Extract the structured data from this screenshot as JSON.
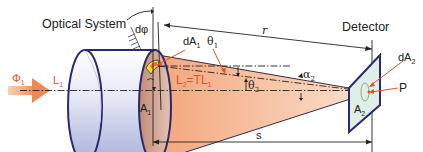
{
  "diagram": {
    "title_labels": {
      "optical_system": "Optical System",
      "detector": "Detector"
    },
    "symbols": {
      "d_phi": "dφ",
      "r": "r",
      "dA1": "dA",
      "dA1_sub": "1",
      "theta1": "θ",
      "theta1_sub": "1",
      "theta2": "θ",
      "theta2_sub": "2",
      "alpha2": "α",
      "alpha2_sub": "2",
      "dA2": "dA",
      "dA2_sub": "2",
      "P": "P",
      "Phi1": "Φ",
      "Phi1_sub": "1",
      "L1": "L",
      "L1_sub": "1",
      "L2_eq": "L",
      "L2_sub": "2",
      "L2_rhs": "=TL",
      "L2_rhs_sub": "1",
      "A1": "A",
      "A1_sub": "1",
      "A2": "A",
      "A2_sub": "2",
      "s": "s"
    },
    "colors": {
      "outline": "#2a2a6e",
      "cone_fill": "#f7b995",
      "red_label": "#e2522a",
      "arrow_orange": "#f0905a",
      "detector_fill": "#dfeee6",
      "lens_fill": "#c99a86",
      "highlight_yellow": "#f5e12a"
    }
  }
}
